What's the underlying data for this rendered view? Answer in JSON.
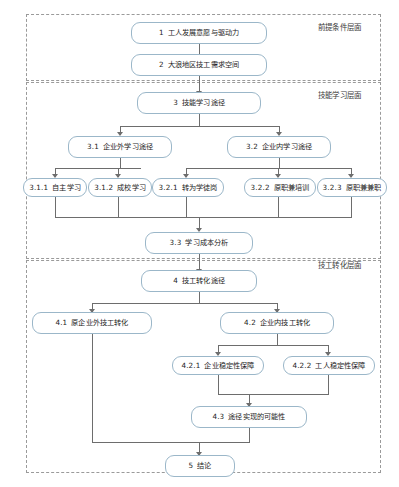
{
  "diagram": {
    "title_note": "技工发展路径流程图",
    "layers": [
      {
        "id": "layer-premise",
        "label": "前提条件层面"
      },
      {
        "id": "layer-learning",
        "label": "技能学习层面"
      },
      {
        "id": "layer-convert",
        "label": "技工转化层面"
      }
    ],
    "nodes": [
      {
        "id": "n1",
        "num": "1",
        "text": "工人发展意愿与驱动力"
      },
      {
        "id": "n2",
        "num": "2",
        "text": "大浪地区技工需求空间"
      },
      {
        "id": "n3",
        "num": "3",
        "text": "技能学习途径"
      },
      {
        "id": "n31",
        "num": "3.1",
        "text": "企业外学习途径"
      },
      {
        "id": "n32",
        "num": "3.2",
        "text": "企业内学习途径"
      },
      {
        "id": "n311",
        "num": "3.1.1",
        "text": "自主学习"
      },
      {
        "id": "n312",
        "num": "3.1.2",
        "text": "成校学习"
      },
      {
        "id": "n321",
        "num": "3.2.1",
        "text": "转为学徒岗"
      },
      {
        "id": "n322",
        "num": "3.2.2",
        "text": "原职兼培训"
      },
      {
        "id": "n323",
        "num": "3.2.3",
        "text": "原职兼兼职"
      },
      {
        "id": "n33",
        "num": "3.3",
        "text": "学习成本分析"
      },
      {
        "id": "n4",
        "num": "4",
        "text": "技工转化途径"
      },
      {
        "id": "n41",
        "num": "4.1",
        "text": "原企业外技工转化"
      },
      {
        "id": "n42",
        "num": "4.2",
        "text": "企业内技工转化"
      },
      {
        "id": "n421",
        "num": "4.2.1",
        "text": "企业稳定性保障"
      },
      {
        "id": "n422",
        "num": "4.2.2",
        "text": "工人稳定性保障"
      },
      {
        "id": "n43",
        "num": "4.3",
        "text": "途径实现的可能性"
      },
      {
        "id": "n5",
        "num": "5",
        "text": "结论"
      }
    ],
    "colors": {
      "node_border": "#9bb7c9",
      "layer_border": "#9a9a9a",
      "connector": "#6d6d6d",
      "background": "#ffffff"
    }
  }
}
